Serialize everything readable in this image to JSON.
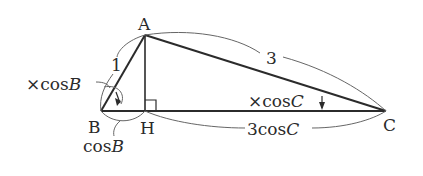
{
  "diagram": {
    "type": "triangle",
    "vertices": [
      {
        "name": "A",
        "label": "A"
      },
      {
        "name": "B",
        "label": "B"
      },
      {
        "name": "H",
        "label": "H"
      },
      {
        "name": "C",
        "label": "C"
      }
    ],
    "side_labels": {
      "AB": "1",
      "AC": "3",
      "BH_prefix": "cos",
      "BH_var": "B",
      "HC_prefix": "3cos",
      "HC_var": "C"
    },
    "operation_labels": {
      "times_cosB_prefix": "×cos",
      "times_cosB_var": "B",
      "times_cosC_prefix": "×cos",
      "times_cosC_var": "C"
    },
    "right_angle_at": "H",
    "colors": {
      "line": "#2b2b2b",
      "arc": "#555555",
      "text": "#2a2a2a",
      "background": "#ffffff"
    }
  }
}
